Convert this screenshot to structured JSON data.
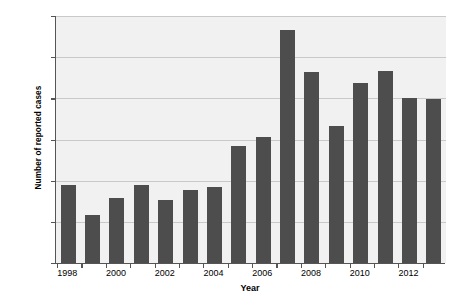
{
  "chart_data": {
    "type": "bar",
    "title": "",
    "xlabel": "Year",
    "ylabel": "Number of reported cases",
    "categories": [
      "1998",
      "1999",
      "2000",
      "2001",
      "2002",
      "2003",
      "2004",
      "2005",
      "2006",
      "2007",
      "2008",
      "2009",
      "2010",
      "2011",
      "2012",
      "2013"
    ],
    "values": [
      3800,
      2350,
      3150,
      3800,
      3050,
      3550,
      3700,
      5700,
      6100,
      11300,
      9300,
      6650,
      8750,
      9350,
      8000,
      7950
    ],
    "ylim": [
      0,
      12000
    ],
    "ytick_values": [
      0,
      2000,
      4000,
      6000,
      8000,
      10000,
      12000
    ],
    "ytick_labels": [
      "0",
      "2,000",
      "4,000",
      "6,000",
      "8,000",
      "10,000",
      "12,000"
    ],
    "xtick_labels": [
      "1998",
      "2000",
      "2002",
      "2004",
      "2006",
      "2008",
      "2010",
      "2012"
    ],
    "xtick_categories": [
      "1998",
      "2000",
      "2002",
      "2004",
      "2006",
      "2008",
      "2010",
      "2012"
    ],
    "grid": "horizontal",
    "legend": "none",
    "bar_color": "#4d4d4d",
    "plot_background": "#f1f1f1",
    "gridline_color": "#c9c9c9",
    "axis_color": "#555555"
  }
}
